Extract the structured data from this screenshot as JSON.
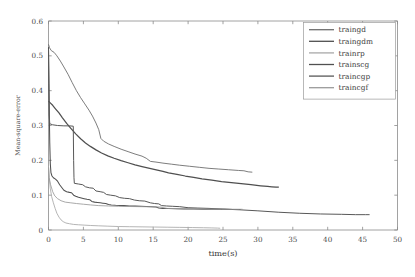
{
  "chart_data": {
    "type": "line",
    "title": "",
    "subtitle": "",
    "xlabel": "time(s)",
    "ylabel": "Mean-square-error",
    "xlim": [
      0,
      50
    ],
    "ylim": [
      0,
      0.6
    ],
    "xticks": [
      0,
      5,
      10,
      15,
      20,
      25,
      30,
      35,
      40,
      45,
      50
    ],
    "xtick_labels": [
      "0",
      "5",
      "10",
      "15",
      "20",
      "25",
      "30",
      "35",
      "40",
      "45",
      "50"
    ],
    "yticks": [
      0,
      0.1,
      0.2,
      0.3,
      0.4,
      0.5,
      0.6
    ],
    "ytick_labels": [
      "0",
      "0.1",
      "0.2",
      "0.3",
      "0.4",
      "0.5",
      "0.6"
    ],
    "grid": false,
    "legend_position": "top-right",
    "legend_entries": [
      "traingd",
      "traingdm",
      "trainrp",
      "trainscg",
      "traincgp",
      "traincgf"
    ],
    "series": [
      {
        "name": "traingd",
        "color": "#6e6e6e",
        "width": 0.9,
        "points": [
          [
            0.0,
            0.533
          ],
          [
            0.15,
            0.523
          ],
          [
            0.4,
            0.515
          ],
          [
            0.8,
            0.51
          ],
          [
            1.2,
            0.5
          ],
          [
            1.7,
            0.485
          ],
          [
            2.2,
            0.468
          ],
          [
            2.8,
            0.447
          ],
          [
            3.4,
            0.423
          ],
          [
            4.0,
            0.4
          ],
          [
            4.6,
            0.38
          ],
          [
            5.2,
            0.362
          ],
          [
            5.8,
            0.344
          ],
          [
            6.3,
            0.327
          ],
          [
            6.8,
            0.307
          ],
          [
            7.2,
            0.288
          ],
          [
            7.5,
            0.263
          ],
          [
            7.9,
            0.255
          ],
          [
            8.6,
            0.247
          ],
          [
            9.4,
            0.24
          ],
          [
            10.4,
            0.232
          ],
          [
            11.4,
            0.225
          ],
          [
            12.4,
            0.218
          ],
          [
            13.4,
            0.212
          ],
          [
            14.0,
            0.206
          ],
          [
            14.6,
            0.197
          ],
          [
            15.4,
            0.195
          ],
          [
            16.4,
            0.192
          ],
          [
            17.6,
            0.189
          ],
          [
            18.8,
            0.186
          ],
          [
            20.2,
            0.183
          ],
          [
            21.6,
            0.18
          ],
          [
            23.0,
            0.177
          ],
          [
            24.4,
            0.175
          ],
          [
            25.8,
            0.173
          ],
          [
            27.2,
            0.171
          ],
          [
            28.0,
            0.17
          ],
          [
            28.6,
            0.167
          ],
          [
            29.2,
            0.166
          ]
        ]
      },
      {
        "name": "traingdm",
        "color": "#4f4f4f",
        "width": 1.25,
        "points": [
          [
            0.0,
            0.37
          ],
          [
            0.25,
            0.365
          ],
          [
            0.6,
            0.358
          ],
          [
            1.0,
            0.348
          ],
          [
            1.5,
            0.336
          ],
          [
            2.0,
            0.322
          ],
          [
            2.6,
            0.306
          ],
          [
            3.2,
            0.292
          ],
          [
            3.9,
            0.276
          ],
          [
            4.6,
            0.262
          ],
          [
            5.3,
            0.25
          ],
          [
            6.0,
            0.24
          ],
          [
            6.8,
            0.23
          ],
          [
            7.6,
            0.221
          ],
          [
            8.5,
            0.213
          ],
          [
            9.4,
            0.206
          ],
          [
            10.4,
            0.199
          ],
          [
            11.4,
            0.193
          ],
          [
            12.4,
            0.187
          ],
          [
            13.4,
            0.182
          ],
          [
            14.5,
            0.177
          ],
          [
            15.6,
            0.172
          ],
          [
            16.4,
            0.168
          ],
          [
            17.2,
            0.164
          ],
          [
            18.4,
            0.16
          ],
          [
            19.6,
            0.155
          ],
          [
            20.8,
            0.151
          ],
          [
            22.0,
            0.147
          ],
          [
            23.4,
            0.143
          ],
          [
            24.8,
            0.139
          ],
          [
            26.2,
            0.136
          ],
          [
            27.6,
            0.133
          ],
          [
            29.0,
            0.13
          ],
          [
            30.4,
            0.127
          ],
          [
            31.4,
            0.125
          ],
          [
            32.0,
            0.124
          ],
          [
            32.6,
            0.123
          ],
          [
            33.0,
            0.123
          ]
        ]
      },
      {
        "name": "trainrp",
        "color": "#a8a8a8",
        "width": 0.85,
        "points": [
          [
            0.0,
            0.183
          ],
          [
            0.1,
            0.15
          ],
          [
            0.25,
            0.12
          ],
          [
            0.45,
            0.096
          ],
          [
            0.7,
            0.078
          ],
          [
            0.95,
            0.062
          ],
          [
            1.2,
            0.048
          ],
          [
            1.5,
            0.037
          ],
          [
            1.8,
            0.029
          ],
          [
            2.1,
            0.024
          ],
          [
            2.5,
            0.02
          ],
          [
            3.0,
            0.018
          ],
          [
            3.6,
            0.016
          ],
          [
            4.3,
            0.015
          ],
          [
            5.1,
            0.014
          ],
          [
            6.0,
            0.013
          ],
          [
            7.2,
            0.012
          ],
          [
            8.5,
            0.011
          ],
          [
            10.0,
            0.01
          ],
          [
            11.6,
            0.0095
          ],
          [
            13.4,
            0.009
          ],
          [
            15.2,
            0.0085
          ],
          [
            17.0,
            0.008
          ],
          [
            18.8,
            0.0075
          ],
          [
            20.6,
            0.007
          ],
          [
            22.2,
            0.0065
          ],
          [
            23.4,
            0.006
          ],
          [
            24.2,
            0.0055
          ],
          [
            24.6,
            0.005
          ]
        ]
      },
      {
        "name": "trainscg",
        "color": "#505050",
        "width": 1.05,
        "points": [
          [
            0.0,
            0.525
          ],
          [
            0.06,
            0.43
          ],
          [
            0.12,
            0.33
          ],
          [
            0.18,
            0.25
          ],
          [
            0.26,
            0.19
          ],
          [
            0.35,
            0.165
          ],
          [
            0.5,
            0.155
          ],
          [
            0.7,
            0.15
          ],
          [
            1.0,
            0.146
          ],
          [
            1.3,
            0.14
          ],
          [
            1.6,
            0.13
          ],
          [
            1.9,
            0.122
          ],
          [
            2.2,
            0.114
          ],
          [
            2.6,
            0.11
          ],
          [
            3.0,
            0.108
          ],
          [
            3.3,
            0.107
          ],
          [
            3.6,
            0.1
          ],
          [
            3.9,
            0.097
          ],
          [
            4.3,
            0.094
          ],
          [
            4.7,
            0.092
          ],
          [
            5.1,
            0.09
          ],
          [
            5.5,
            0.088
          ],
          [
            5.9,
            0.087
          ],
          [
            6.2,
            0.082
          ],
          [
            6.6,
            0.08
          ],
          [
            7.0,
            0.079
          ],
          [
            7.4,
            0.078
          ],
          [
            7.8,
            0.077
          ],
          [
            8.2,
            0.076
          ],
          [
            8.6,
            0.073
          ],
          [
            9.0,
            0.072
          ],
          [
            9.6,
            0.071
          ],
          [
            10.2,
            0.0705
          ],
          [
            10.8,
            0.07
          ],
          [
            11.6,
            0.069
          ],
          [
            12.4,
            0.0685
          ],
          [
            13.2,
            0.068
          ],
          [
            14.0,
            0.0675
          ],
          [
            14.8,
            0.067
          ],
          [
            15.4,
            0.066
          ],
          [
            15.8,
            0.063
          ],
          [
            16.4,
            0.062
          ],
          [
            17.2,
            0.0615
          ],
          [
            18.2,
            0.061
          ],
          [
            19.4,
            0.0605
          ],
          [
            20.8,
            0.06
          ],
          [
            22.2,
            0.0598
          ],
          [
            23.8,
            0.0595
          ],
          [
            25.2,
            0.0593
          ],
          [
            26.4,
            0.0591
          ],
          [
            27.2,
            0.059
          ],
          [
            27.6,
            0.059
          ]
        ]
      },
      {
        "name": "traincgp",
        "color": "#585858",
        "width": 1.0,
        "points": [
          [
            0.0,
            0.52
          ],
          [
            0.05,
            0.42
          ],
          [
            0.1,
            0.33
          ],
          [
            0.18,
            0.305
          ],
          [
            0.6,
            0.302
          ],
          [
            1.3,
            0.3
          ],
          [
            2.2,
            0.299
          ],
          [
            3.0,
            0.299
          ],
          [
            3.55,
            0.298
          ],
          [
            3.6,
            0.2
          ],
          [
            3.65,
            0.15
          ],
          [
            3.7,
            0.134
          ],
          [
            4.3,
            0.132
          ],
          [
            4.9,
            0.13
          ],
          [
            5.3,
            0.124
          ],
          [
            5.9,
            0.121
          ],
          [
            6.4,
            0.12
          ],
          [
            6.8,
            0.112
          ],
          [
            7.4,
            0.11
          ],
          [
            7.9,
            0.108
          ],
          [
            8.3,
            0.102
          ],
          [
            8.9,
            0.1
          ],
          [
            9.6,
            0.098
          ],
          [
            10.2,
            0.093
          ],
          [
            10.9,
            0.091
          ],
          [
            11.6,
            0.09
          ],
          [
            12.3,
            0.086
          ],
          [
            13.0,
            0.084
          ],
          [
            13.8,
            0.083
          ],
          [
            14.6,
            0.078
          ],
          [
            15.2,
            0.076
          ],
          [
            15.8,
            0.075
          ],
          [
            16.2,
            0.07
          ],
          [
            16.9,
            0.069
          ],
          [
            17.8,
            0.068
          ],
          [
            18.8,
            0.067
          ],
          [
            20.0,
            0.064
          ],
          [
            21.4,
            0.063
          ],
          [
            23.0,
            0.062
          ],
          [
            25.0,
            0.06
          ],
          [
            27.4,
            0.058
          ],
          [
            30.0,
            0.055
          ],
          [
            33.0,
            0.051
          ],
          [
            36.0,
            0.048
          ],
          [
            39.0,
            0.046
          ],
          [
            42.0,
            0.045
          ],
          [
            44.0,
            0.044
          ],
          [
            45.4,
            0.044
          ],
          [
            46.0,
            0.044
          ]
        ]
      },
      {
        "name": "traincgf",
        "color": "#9a9a9a",
        "width": 0.85,
        "points": [
          [
            0.0,
            0.18
          ],
          [
            0.1,
            0.15
          ],
          [
            0.3,
            0.13
          ],
          [
            0.6,
            0.11
          ],
          [
            0.9,
            0.098
          ],
          [
            1.3,
            0.09
          ],
          [
            1.8,
            0.084
          ],
          [
            2.4,
            0.08
          ],
          [
            3.2,
            0.078
          ],
          [
            4.0,
            0.076
          ],
          [
            5.0,
            0.074
          ],
          [
            6.0,
            0.072
          ],
          [
            7.2,
            0.07
          ],
          [
            8.6,
            0.069
          ],
          [
            10.0,
            0.068
          ],
          [
            11.6,
            0.0675
          ],
          [
            13.2,
            0.067
          ],
          [
            14.8,
            0.0665
          ],
          [
            16.0,
            0.066
          ],
          [
            17.0,
            0.062
          ],
          [
            18.4,
            0.0615
          ],
          [
            20.0,
            0.061
          ],
          [
            21.6,
            0.0605
          ],
          [
            23.2,
            0.06
          ],
          [
            24.8,
            0.0598
          ],
          [
            26.4,
            0.0596
          ],
          [
            27.4,
            0.0595
          ],
          [
            27.8,
            0.0595
          ]
        ]
      }
    ]
  },
  "axes": {
    "x_label": "time(s)",
    "y_label": "Mean-square-error"
  }
}
